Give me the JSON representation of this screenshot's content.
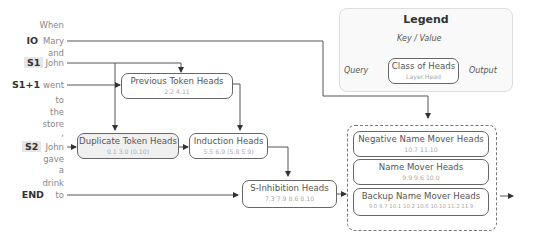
{
  "tokens": [
    {
      "word": "When",
      "label": ""
    },
    {
      "word": "Mary",
      "label": "IO"
    },
    {
      "word": "and",
      "label": ""
    },
    {
      "word": "John",
      "label": "S1"
    },
    {
      "word": "went",
      "label": "S1+1"
    },
    {
      "word": "to",
      "label": ""
    },
    {
      "word": "the",
      "label": ""
    },
    {
      "word": "store",
      "label": ""
    },
    {
      "word": ",",
      "label": ""
    },
    {
      "word": "John",
      "label": "S2"
    },
    {
      "word": "gave",
      "label": ""
    },
    {
      "word": "a",
      "label": ""
    },
    {
      "word": "drink",
      "label": ""
    },
    {
      "word": "to",
      "label": "END"
    }
  ],
  "heads": {
    "previous_token": {
      "title": "Previous Token Heads",
      "layers": "2.2  4.11"
    },
    "duplicate_token": {
      "title": "Duplicate Token Heads",
      "layers": "0.1  3.0  (0.10)"
    },
    "induction": {
      "title": "Induction Heads",
      "layers": "5.5  6.9  (5.8  5.9)"
    },
    "s_inhibition": {
      "title": "S-Inhibition Heads",
      "layers": "7.3  7.9  8.6  8.10"
    },
    "negative_name_mover": {
      "title": "Negative Name Mover Heads",
      "layers": "10.7  11.10"
    },
    "name_mover": {
      "title": "Name Mover Heads",
      "layers": "9.9  9.6  10.0"
    },
    "backup_name_mover": {
      "title": "Backup Name Mover Heads",
      "layers": "9.0  9.7  10.1  10.2  10.6  10.10  11.2  11.9"
    }
  },
  "legend": {
    "title": "Legend",
    "key_value": "Key / Value",
    "query": "Query",
    "output": "Output",
    "class_title": "Class of Heads",
    "class_sub": "Layer.Head"
  }
}
